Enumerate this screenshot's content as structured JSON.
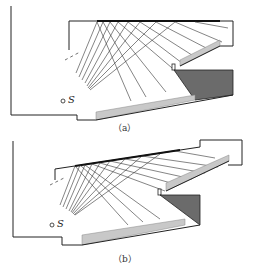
{
  "figure": {
    "panels": [
      {
        "id": "a",
        "caption": "（a）",
        "source_label": "S",
        "colors": {
          "wall": "#222222",
          "balcony_light": "#c8c8c8",
          "block_dark": "#6b6b6b",
          "rays": "#333333",
          "reflector": "#111111"
        }
      },
      {
        "id": "b",
        "caption": "（b）",
        "source_label": "S",
        "colors": {
          "wall": "#222222",
          "balcony_light": "#c8c8c8",
          "block_dark": "#6b6b6b",
          "rays": "#333333",
          "reflector": "#111111"
        }
      }
    ]
  }
}
